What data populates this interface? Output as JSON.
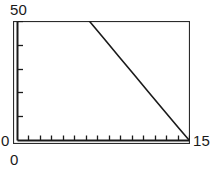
{
  "chart_data": {
    "type": "line",
    "title": "",
    "subtitle": "",
    "xlabel": "",
    "ylabel": "",
    "xlim": [
      0,
      150
    ],
    "ylim": [
      0,
      50
    ],
    "grid": false,
    "legend": null,
    "axis_labels": {
      "y_max": "50",
      "y_min": "0",
      "x_min": "0",
      "x_max": "15"
    },
    "ticks": {
      "x_major_count": 15,
      "x_tick_step": 10,
      "y_major_count": 5,
      "y_tick_step": 10,
      "x_tick_values": [
        0,
        10,
        20,
        30,
        40,
        50,
        60,
        70,
        80,
        90,
        100,
        110,
        120,
        130,
        140,
        150
      ],
      "y_tick_values": [
        0,
        10,
        20,
        30,
        40,
        50
      ]
    },
    "series": [
      {
        "name": "series-1",
        "color": "#1a1a1a",
        "x": [
          63,
          150
        ],
        "y": [
          50,
          0
        ],
        "points": [
          {
            "x": 63,
            "y": 50
          },
          {
            "x": 76,
            "y": 42.5
          },
          {
            "x": 89,
            "y": 35
          },
          {
            "x": 102,
            "y": 27.5
          },
          {
            "x": 115,
            "y": 20
          },
          {
            "x": 128,
            "y": 12.5
          },
          {
            "x": 141,
            "y": 5
          },
          {
            "x": 150,
            "y": 0
          }
        ]
      }
    ],
    "colors": {
      "line": "#1a1a1a",
      "axis": "#1a1a1a",
      "frame": "#2b2b2b",
      "background": "#ffffff",
      "text": "#1a1a1a"
    }
  }
}
